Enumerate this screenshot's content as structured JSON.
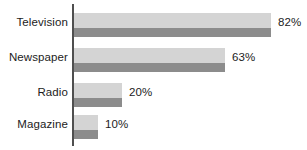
{
  "chart_data": {
    "type": "bar",
    "orientation": "horizontal",
    "title": "",
    "subtitle": "",
    "xlabel": "",
    "ylabel": "",
    "categories": [
      "Television",
      "Newspaper",
      "Radio",
      "Magazine"
    ],
    "values": [
      82,
      63,
      20,
      10
    ],
    "value_labels": [
      "82%",
      "63%",
      "20%",
      "10%"
    ],
    "xlim": [
      0,
      100
    ],
    "grid": false,
    "legend": null,
    "axis_line": "vertical-category-axis",
    "colors": {
      "bar_light": "#d4d4d4",
      "bar_dark": "#8c8c8c",
      "axis": "#4f4f4f",
      "text": "#1c1c1c",
      "background": "#ffffff"
    },
    "series": [
      {
        "name": "percent",
        "values": [
          82,
          63,
          20,
          10
        ]
      }
    ],
    "points": [
      {
        "category": "Television",
        "value": 82,
        "label": "82%"
      },
      {
        "category": "Newspaper",
        "value": 63,
        "label": "63%"
      },
      {
        "category": "Radio",
        "value": 20,
        "label": "20%"
      },
      {
        "category": "Magazine",
        "value": 10,
        "label": "10%"
      }
    ]
  },
  "layout": {
    "axis_x_px": 72,
    "bar_start_px": 74,
    "px_per_percent": 2.4,
    "row_tops_px": [
      13,
      48,
      83,
      115
    ]
  }
}
